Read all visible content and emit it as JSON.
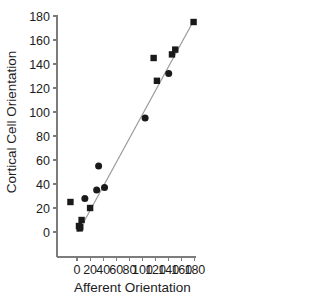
{
  "chart_data": {
    "type": "scatter",
    "title": "",
    "xlabel": "Afferent Orientation",
    "ylabel": "Cortical Cell Orientation",
    "xlim": [
      -18,
      185
    ],
    "ylim": [
      -18,
      185
    ],
    "xticks": [
      0,
      20,
      40,
      60,
      80,
      100,
      120,
      140,
      160,
      180
    ],
    "yticks": [
      0,
      20,
      40,
      60,
      80,
      100,
      120,
      140,
      160,
      180
    ],
    "xtick_labels": [
      "0",
      "20",
      "40",
      "60",
      "80",
      "100",
      "120",
      "140",
      "160",
      "180"
    ],
    "ytick_labels": [
      "0",
      "20",
      "40",
      "60",
      "80",
      "100",
      "120",
      "140",
      "160",
      "180"
    ],
    "grid": false,
    "legend": null,
    "marker_color": "#1a1a1a",
    "fit_line_color": "#9a9a9a",
    "series": [
      {
        "name": "square-markers",
        "marker": "square",
        "points": [
          [
            -10,
            25
          ],
          [
            3,
            5
          ],
          [
            4,
            3
          ],
          [
            5,
            4
          ],
          [
            7,
            10
          ],
          [
            20,
            20
          ],
          [
            117,
            145
          ],
          [
            122,
            126
          ],
          [
            145,
            148
          ],
          [
            150,
            152
          ],
          [
            178,
            175
          ]
        ]
      },
      {
        "name": "circle-markers",
        "marker": "circle",
        "points": [
          [
            12,
            28
          ],
          [
            30,
            35
          ],
          [
            33,
            55
          ],
          [
            42,
            37
          ],
          [
            104,
            95
          ],
          [
            140,
            132
          ]
        ]
      }
    ],
    "fit_line": {
      "name": "regression-line",
      "x0": 2,
      "y0": 0,
      "x1": 178,
      "y1": 176
    }
  }
}
